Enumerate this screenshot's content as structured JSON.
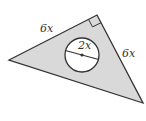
{
  "figure": {
    "colors": {
      "fill": "#d9d9d9",
      "stroke": "#333333",
      "circle_fill": "#ffffff",
      "background": "#ffffff"
    },
    "triangle": {
      "vertices": [
        [
          9,
          60
        ],
        [
          97,
          15
        ],
        [
          143,
          103
        ]
      ],
      "right_angle_vertex": [
        97,
        15
      ]
    },
    "circle": {
      "cx": 82,
      "cy": 55,
      "r": 17
    },
    "labels": {
      "left_leg": "6x",
      "right_leg": "6x",
      "diameter": "2x"
    }
  }
}
